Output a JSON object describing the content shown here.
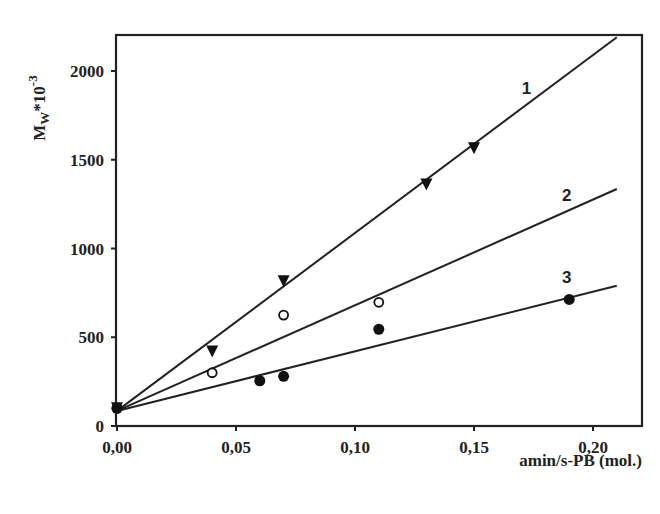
{
  "chart_data": {
    "type": "scatter",
    "title": "",
    "xlabel": "amin/s-PB (mol.)",
    "ylabel": "Mw*10^-3",
    "ylabel_parts": {
      "main": "M",
      "sub": "W",
      "rest": "*10",
      "sup": "-3"
    },
    "xlim": [
      0,
      0.21
    ],
    "ylim": [
      0,
      2200
    ],
    "x_ticks": [
      0,
      0.05,
      0.1,
      0.15,
      0.2
    ],
    "x_tick_labels": [
      "0,00",
      "0,05",
      "0,10",
      "0,15",
      "0,20"
    ],
    "y_ticks": [
      0,
      500,
      1000,
      1500,
      2000
    ],
    "y_tick_labels": [
      "0",
      "500",
      "1000",
      "1500",
      "2000"
    ],
    "grid": false,
    "legend": "inline line labels",
    "series": [
      {
        "name": "1",
        "marker": "filled-down-triangle",
        "points": [
          [
            0,
            100
          ],
          [
            0.04,
            420
          ],
          [
            0.07,
            815
          ],
          [
            0.13,
            1360
          ],
          [
            0.15,
            1565
          ]
        ],
        "fit_line": {
          "x": [
            0,
            0.21
          ],
          "y": [
            85,
            2190
          ]
        },
        "label_position": {
          "x": 0.172,
          "y": 1870
        }
      },
      {
        "name": "2",
        "marker": "open-circle",
        "points": [
          [
            0,
            100
          ],
          [
            0.04,
            300
          ],
          [
            0.07,
            625
          ],
          [
            0.11,
            697
          ]
        ],
        "fit_line": {
          "x": [
            0,
            0.21
          ],
          "y": [
            85,
            1335
          ]
        },
        "label_position": {
          "x": 0.189,
          "y": 1270
        }
      },
      {
        "name": "3",
        "marker": "filled-circle",
        "points": [
          [
            0,
            100
          ],
          [
            0.06,
            255
          ],
          [
            0.07,
            280
          ],
          [
            0.11,
            545
          ],
          [
            0.19,
            713
          ]
        ],
        "fit_line": {
          "x": [
            0,
            0.21
          ],
          "y": [
            85,
            790
          ]
        },
        "label_position": {
          "x": 0.189,
          "y": 805
        }
      }
    ]
  }
}
